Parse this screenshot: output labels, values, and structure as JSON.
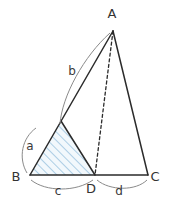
{
  "figure": {
    "background_color": "#ffffff",
    "stroke_color": "#2b2b2b",
    "arc_color": "#8a8a8a",
    "hatch_color": "#8fb8d8",
    "hatch_fill": "#eaf3fa",
    "label_color": "#333333"
  },
  "vertices": {
    "A": {
      "label": "A",
      "x": 113,
      "y": 31,
      "label_x": 112,
      "label_y": 18
    },
    "B": {
      "label": "B",
      "x": 30,
      "y": 175,
      "label_x": 16,
      "label_y": 181
    },
    "C": {
      "label": "C",
      "x": 148,
      "y": 175,
      "label_x": 155,
      "label_y": 181
    },
    "D": {
      "label": "D",
      "x": 95,
      "y": 175,
      "label_x": 91,
      "label_y": 193
    },
    "E": {
      "label": "",
      "x": 61,
      "y": 121,
      "label_x": 61,
      "label_y": 121
    }
  },
  "segments": {
    "BA": {
      "name": "B-to-A",
      "style": "solid"
    },
    "AC": {
      "name": "A-to-C",
      "style": "solid"
    },
    "BC": {
      "name": "B-to-C",
      "style": "solid"
    },
    "AD": {
      "name": "A-to-D",
      "style": "dashed"
    },
    "ED": {
      "name": "E-to-D",
      "style": "solid"
    }
  },
  "measure_labels": [
    {
      "id": "a",
      "text": "a",
      "x": 30,
      "y": 150,
      "desc": "side B to E of shaded triangle"
    },
    {
      "id": "b",
      "text": "b",
      "x": 72,
      "y": 75,
      "desc": "segment E to A"
    },
    {
      "id": "c",
      "text": "c",
      "x": 58,
      "y": 195,
      "desc": "base B to D"
    },
    {
      "id": "d",
      "text": "d",
      "x": 119,
      "y": 195,
      "desc": "base D to C"
    }
  ],
  "shaded_region": {
    "name": "triangle-BED",
    "points": "30,175 61,121 95,175",
    "pattern": "diagonal-hatch",
    "angle_deg": 45
  },
  "arcs": [
    {
      "id": "arc-a",
      "path": "M 27,173 C 18,158 22,138 36,128",
      "label": "a"
    },
    {
      "id": "arc-b",
      "path": "M 60,124 C 62,96 84,56 110,33",
      "label": "b"
    },
    {
      "id": "arc-c",
      "path": "M 31,180 C 46,192 76,192 93,180",
      "label": "c"
    },
    {
      "id": "arc-d",
      "path": "M 97,180 C 110,191 136,191 147,180",
      "label": "d"
    }
  ]
}
